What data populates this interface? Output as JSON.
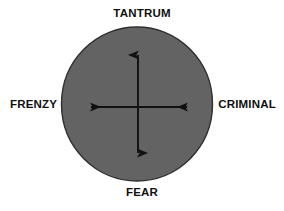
{
  "diagram": {
    "type": "circle-with-crossed-axes",
    "background_color": "#ffffff",
    "circle": {
      "fill_color": "#636363",
      "stroke_color": "#2b2b2b",
      "center_x": 137,
      "center_y": 104,
      "radius_x": 75,
      "radius_y": 77
    },
    "arrows": {
      "color": "#111111",
      "center_x": 138,
      "center_y": 107,
      "vertical": {
        "top_y": 52,
        "bottom_y": 156,
        "double_headed": true
      },
      "horizontal": {
        "left_x": 88,
        "right_x": 190,
        "double_headed": true
      }
    },
    "labels": {
      "top": "TANTRUM",
      "bottom": "FEAR",
      "left": "FRENZY",
      "right": "CRIMINAL"
    }
  }
}
